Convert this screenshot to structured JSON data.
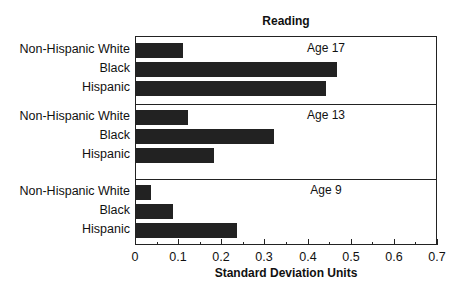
{
  "chart_data": {
    "type": "bar",
    "orientation": "horizontal",
    "title": "Reading",
    "xlabel": "Standard Deviation Units",
    "ylabel": "",
    "xlim": [
      0,
      0.7
    ],
    "xticks": [
      "0",
      "0.1",
      "0.2",
      "0.3",
      "0.4",
      "0.5",
      "0.6",
      "0.7"
    ],
    "grid": false,
    "legend": null,
    "categories": [
      "Non-Hispanic White",
      "Black",
      "Hispanic"
    ],
    "panels": [
      {
        "label": "Age 17",
        "values": [
          0.11,
          0.465,
          0.44
        ]
      },
      {
        "label": "Age 13",
        "values": [
          0.12,
          0.32,
          0.18
        ]
      },
      {
        "label": "Age 9",
        "values": [
          0.035,
          0.085,
          0.235
        ]
      }
    ]
  }
}
